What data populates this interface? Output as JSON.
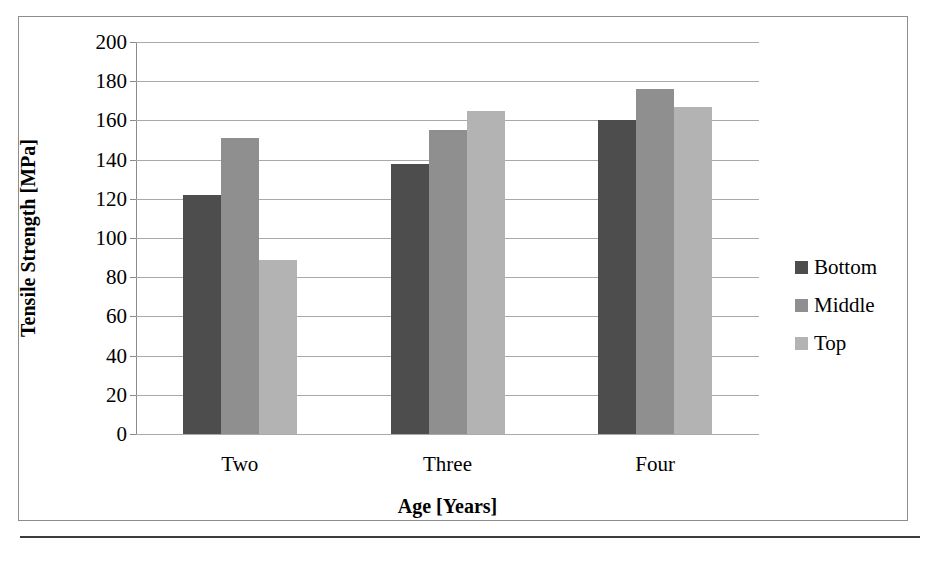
{
  "figure": {
    "frame_visible": true,
    "background": "#ffffff"
  },
  "chart_data": {
    "type": "bar",
    "title": "",
    "xlabel": "Age [Years]",
    "ylabel": "Tensile Strength [MPa]",
    "categories": [
      "Two",
      "Three",
      "Four"
    ],
    "series": [
      {
        "name": "Bottom",
        "color": "#4d4d4d",
        "values": [
          122,
          138,
          160
        ]
      },
      {
        "name": "Middle",
        "color": "#8f8f8f",
        "values": [
          151,
          155,
          176
        ]
      },
      {
        "name": "Top",
        "color": "#b3b3b3",
        "values": [
          89,
          165,
          167
        ]
      }
    ],
    "ylim": [
      0,
      200
    ],
    "ytick_step": 20,
    "yticks": [
      0,
      20,
      40,
      60,
      80,
      100,
      120,
      140,
      160,
      180,
      200
    ],
    "ytick_labels": [
      "0",
      "20",
      "40",
      "60",
      "80",
      "100",
      "120",
      "140",
      "160",
      "180",
      "200"
    ],
    "grid": true,
    "grid_axis": "y",
    "legend_position": "right",
    "legend_entries": [
      "Bottom",
      "Middle",
      "Top"
    ],
    "bar_group_order": [
      "Bottom",
      "Middle",
      "Top"
    ]
  }
}
